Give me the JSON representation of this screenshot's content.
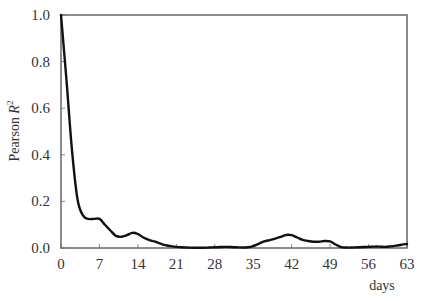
{
  "chart_data": {
    "type": "line",
    "title": "",
    "xlabel": "days",
    "ylabel": "Pearson R²",
    "ylabel_parts": {
      "prefix": "Pearson ",
      "var": "R",
      "sup": "2"
    },
    "xlim": [
      0,
      63
    ],
    "ylim": [
      0.0,
      1.0
    ],
    "x_ticks": [
      0,
      7,
      14,
      21,
      28,
      35,
      42,
      49,
      56,
      63
    ],
    "y_ticks": [
      0.0,
      0.2,
      0.4,
      0.6,
      0.8,
      1.0
    ],
    "y_tick_labels": [
      "0.0",
      "0.2",
      "0.4",
      "0.6",
      "0.8",
      "1.0"
    ],
    "grid": false,
    "legend": null,
    "series": [
      {
        "name": "Pearson R²",
        "color": "#111111",
        "x": [
          0,
          1,
          2,
          3,
          4,
          5,
          6,
          7,
          8,
          9,
          10,
          11,
          12,
          13,
          14,
          15,
          16,
          17,
          18,
          19,
          20,
          21,
          22,
          23,
          24,
          25,
          26,
          27,
          28,
          29,
          30,
          31,
          32,
          33,
          34,
          35,
          36,
          37,
          38,
          39,
          40,
          41,
          42,
          43,
          44,
          45,
          46,
          47,
          48,
          49,
          50,
          51,
          52,
          53,
          54,
          55,
          56,
          57,
          58,
          59,
          60,
          61,
          62,
          63
        ],
        "values": [
          1.0,
          0.72,
          0.42,
          0.21,
          0.14,
          0.125,
          0.125,
          0.125,
          0.1,
          0.075,
          0.052,
          0.048,
          0.055,
          0.065,
          0.06,
          0.045,
          0.035,
          0.028,
          0.02,
          0.012,
          0.008,
          0.005,
          0.003,
          0.002,
          0.001,
          0.001,
          0.001,
          0.002,
          0.003,
          0.004,
          0.005,
          0.004,
          0.003,
          0.002,
          0.003,
          0.008,
          0.018,
          0.028,
          0.034,
          0.04,
          0.048,
          0.056,
          0.055,
          0.045,
          0.035,
          0.03,
          0.027,
          0.027,
          0.03,
          0.028,
          0.015,
          0.004,
          0.002,
          0.002,
          0.003,
          0.004,
          0.005,
          0.006,
          0.006,
          0.005,
          0.007,
          0.01,
          0.014,
          0.017
        ]
      }
    ]
  }
}
